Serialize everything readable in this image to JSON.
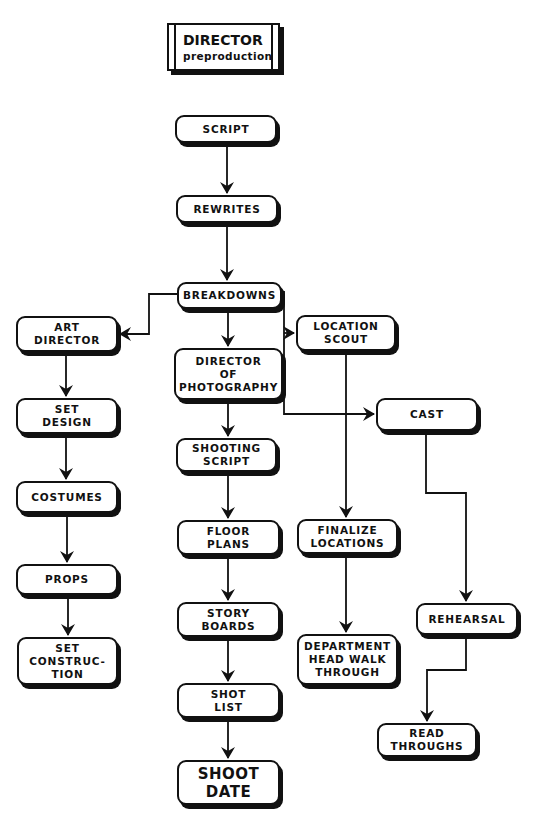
{
  "title": {
    "main": "DIRECTOR",
    "sub": "preproduction"
  },
  "nodes": {
    "script": "SCRIPT",
    "rewrites": "REWRITES",
    "breakdowns": "BREAKDOWNS",
    "art_director": "ART\nDIRECTOR",
    "director_of_photography": "DIRECTOR\nOF\nPHOTOGRAPHY",
    "location_scout": "LOCATION\nSCOUT",
    "cast": "CAST",
    "set_design": "SET\nDESIGN",
    "costumes": "COSTUMES",
    "props": "PROPS",
    "set_construction": "SET\nCONSTRUC-\nTION",
    "shooting_script": "SHOOTING\nSCRIPT",
    "floor_plans": "FLOOR\nPLANS",
    "story_boards": "STORY\nBOARDS",
    "shot_list": "SHOT\nLIST",
    "shoot_date": "SHOOT\nDATE",
    "finalize_locations": "FINALIZE\nLOCATIONS",
    "department_head_walk_through": "DEPARTMENT\nHEAD WALK\nTHROUGH",
    "rehearsal": "REHEARSAL",
    "read_throughs": "READ\nTHROUGHS"
  },
  "edges": [
    {
      "from": "script",
      "to": "rewrites",
      "bidirectional": true
    },
    {
      "from": "rewrites",
      "to": "breakdowns"
    },
    {
      "from": "breakdowns",
      "to": "art_director"
    },
    {
      "from": "breakdowns",
      "to": "director_of_photography"
    },
    {
      "from": "breakdowns",
      "to": "location_scout"
    },
    {
      "from": "breakdowns",
      "to": "cast"
    },
    {
      "from": "art_director",
      "to": "set_design"
    },
    {
      "from": "set_design",
      "to": "costumes"
    },
    {
      "from": "costumes",
      "to": "props"
    },
    {
      "from": "props",
      "to": "set_construction"
    },
    {
      "from": "director_of_photography",
      "to": "shooting_script"
    },
    {
      "from": "shooting_script",
      "to": "floor_plans"
    },
    {
      "from": "floor_plans",
      "to": "story_boards"
    },
    {
      "from": "story_boards",
      "to": "shot_list"
    },
    {
      "from": "shot_list",
      "to": "shoot_date"
    },
    {
      "from": "location_scout",
      "to": "finalize_locations"
    },
    {
      "from": "finalize_locations",
      "to": "department_head_walk_through"
    },
    {
      "from": "cast",
      "to": "rehearsal"
    },
    {
      "from": "rehearsal",
      "to": "read_throughs"
    }
  ]
}
